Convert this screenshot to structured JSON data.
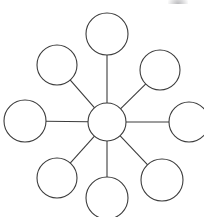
{
  "figure": {
    "type": "radial-node-graph",
    "width": 204,
    "height": 217,
    "background_color": "#ffffff",
    "stroke_color": "#3c3c3c",
    "stroke_width": 1.1,
    "node_fill": "#ffffff"
  },
  "diagram_data": {
    "type": "diagram",
    "layout": "radial",
    "node_count": 9,
    "spoke_count": 8,
    "hub": {
      "id": "hub",
      "label": "",
      "cx": 107,
      "cy": 122,
      "r": 19
    },
    "nodes": [
      {
        "id": "node-n",
        "label": "",
        "position": "top",
        "cx": 107,
        "cy": 34,
        "r": 21,
        "angle_deg": 90
      },
      {
        "id": "node-ne",
        "label": "",
        "position": "top-right",
        "cx": 160,
        "cy": 70,
        "r": 20,
        "angle_deg": 45
      },
      {
        "id": "node-e",
        "label": "",
        "position": "right",
        "cx": 189,
        "cy": 122,
        "r": 20,
        "angle_deg": 0
      },
      {
        "id": "node-se",
        "label": "",
        "position": "bottom-right",
        "cx": 162,
        "cy": 180,
        "r": 21,
        "angle_deg": 315
      },
      {
        "id": "node-s",
        "label": "",
        "position": "bottom",
        "cx": 107,
        "cy": 198,
        "r": 21,
        "angle_deg": 270
      },
      {
        "id": "node-sw",
        "label": "",
        "position": "bottom-left",
        "cx": 57,
        "cy": 178,
        "r": 20,
        "angle_deg": 225
      },
      {
        "id": "node-w",
        "label": "",
        "position": "left",
        "cx": 25,
        "cy": 121,
        "r": 21,
        "angle_deg": 180
      },
      {
        "id": "node-nw",
        "label": "",
        "position": "top-left",
        "cx": 57,
        "cy": 65,
        "r": 20,
        "angle_deg": 135
      }
    ],
    "edges": [
      {
        "id": "spoke-n",
        "from": "hub",
        "to": "node-n"
      },
      {
        "id": "spoke-ne",
        "from": "hub",
        "to": "node-ne"
      },
      {
        "id": "spoke-e",
        "from": "hub",
        "to": "node-e"
      },
      {
        "id": "spoke-se",
        "from": "hub",
        "to": "node-se"
      },
      {
        "id": "spoke-s",
        "from": "hub",
        "to": "node-s"
      },
      {
        "id": "spoke-sw",
        "from": "hub",
        "to": "node-sw"
      },
      {
        "id": "spoke-w",
        "from": "hub",
        "to": "node-w"
      },
      {
        "id": "spoke-nw",
        "from": "hub",
        "to": "node-nw"
      }
    ]
  },
  "artifact": {
    "name": "crop-smudge",
    "description": "faint light-gray scan remnant clipped at top edge",
    "x": 168,
    "y": -5,
    "width": 20,
    "height": 9
  }
}
